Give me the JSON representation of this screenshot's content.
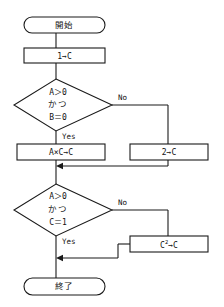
{
  "diagram": {
    "type": "flowchart",
    "language": "ja",
    "orientation": "top-to-bottom",
    "background_color": "#ffffff",
    "line_color": "#1a1a1a",
    "text_color": "#111111"
  },
  "nodes": {
    "start": {
      "id": "start",
      "shape": "terminator",
      "label": "開始"
    },
    "init_c": {
      "id": "init_c",
      "shape": "process",
      "label": "1→C"
    },
    "decision_1": {
      "id": "decision_1",
      "shape": "decision",
      "line1": "A＞0",
      "line2": "かつ",
      "line3": "B＝0"
    },
    "mul_ac": {
      "id": "mul_ac",
      "shape": "process",
      "label": "A×C→C"
    },
    "set_two": {
      "id": "set_two",
      "shape": "process",
      "label": "2→C"
    },
    "decision_2": {
      "id": "decision_2",
      "shape": "decision",
      "line1": "A＞0",
      "line2": "かつ",
      "line3": "C＝1"
    },
    "square_c": {
      "id": "square_c",
      "shape": "process",
      "base": "C",
      "exponent": "2",
      "tail": "→C"
    },
    "end": {
      "id": "end",
      "shape": "terminator",
      "label": "終了"
    }
  },
  "branch_labels": {
    "decision_1_no": "No",
    "decision_1_yes": "Yes",
    "decision_2_no": "No",
    "decision_2_yes": "Yes"
  },
  "edges": [
    {
      "from": "start",
      "to": "init_c",
      "label": ""
    },
    {
      "from": "init_c",
      "to": "decision_1",
      "label": ""
    },
    {
      "from": "decision_1",
      "to": "mul_ac",
      "label": "Yes"
    },
    {
      "from": "decision_1",
      "to": "set_two",
      "label": "No"
    },
    {
      "from": "mul_ac",
      "to": "decision_2",
      "label": ""
    },
    {
      "from": "set_two",
      "to": "decision_2",
      "label": ""
    },
    {
      "from": "decision_2",
      "to": "end",
      "label": "Yes"
    },
    {
      "from": "decision_2",
      "to": "square_c",
      "label": "No"
    },
    {
      "from": "square_c",
      "to": "end",
      "label": ""
    }
  ]
}
